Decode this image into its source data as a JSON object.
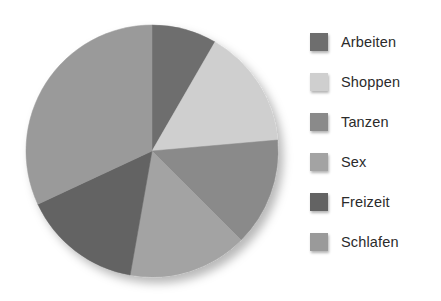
{
  "chart_data": {
    "type": "pie",
    "title": "",
    "subtitle": "",
    "xlabel": "",
    "ylabel": "",
    "grid": false,
    "legend_position": "right",
    "start_angle_deg": 0,
    "direction": "clockwise",
    "categories": [
      "Arbeiten",
      "Shoppen",
      "Tanzen",
      "Sex",
      "Freizeit",
      "Schlafen"
    ],
    "values": [
      8.3,
      15.3,
      13.9,
      15.3,
      15.3,
      31.9
    ],
    "angles_deg": [
      30,
      55,
      50,
      55,
      55,
      115
    ],
    "colors": [
      "#6e6e6e",
      "#cfcfcf",
      "#8a8a8a",
      "#a3a3a3",
      "#636363",
      "#9a9a9a"
    ],
    "slices": [
      {
        "label": "Arbeiten",
        "value": 8.3,
        "angle_deg": 30,
        "color": "#6e6e6e"
      },
      {
        "label": "Shoppen",
        "value": 15.3,
        "angle_deg": 55,
        "color": "#cfcfcf"
      },
      {
        "label": "Tanzen",
        "value": 13.9,
        "angle_deg": 50,
        "color": "#8a8a8a"
      },
      {
        "label": "Sex",
        "value": 15.3,
        "angle_deg": 55,
        "color": "#a3a3a3"
      },
      {
        "label": "Freizeit",
        "value": 15.3,
        "angle_deg": 55,
        "color": "#636363"
      },
      {
        "label": "Schlafen",
        "value": 31.9,
        "angle_deg": 115,
        "color": "#9a9a9a"
      }
    ]
  },
  "legend": {
    "items": [
      {
        "label": "Arbeiten",
        "color": "#6e6e6e"
      },
      {
        "label": "Shoppen",
        "color": "#cfcfcf"
      },
      {
        "label": "Tanzen",
        "color": "#8a8a8a"
      },
      {
        "label": "Sex",
        "color": "#a3a3a3"
      },
      {
        "label": "Freizeit",
        "color": "#636363"
      },
      {
        "label": "Schlafen",
        "color": "#9a9a9a"
      }
    ]
  },
  "style": {
    "background": "#ffffff",
    "text_color": "#2b2b2b"
  }
}
